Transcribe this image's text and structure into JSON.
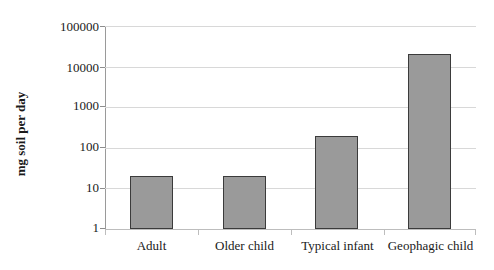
{
  "chart_data": {
    "type": "bar",
    "title": "",
    "subtitle": "",
    "xlabel": "",
    "ylabel": "mg soil per day",
    "categories": [
      "Adult",
      "Older child",
      "Typical infant",
      "Geophagic child"
    ],
    "values": [
      20,
      20,
      200,
      20000
    ],
    "series": [
      {
        "name": "mg soil per day",
        "values": [
          20,
          20,
          200,
          20000
        ]
      }
    ],
    "yscale": "log",
    "ylim": [
      1,
      100000
    ],
    "ytick_labels": [
      "1",
      "10",
      "100",
      "1000",
      "10000",
      "100000"
    ],
    "ytick_values": [
      1,
      10,
      100,
      1000,
      10000,
      100000
    ],
    "grid": "horizontal",
    "legend": "none",
    "bar_fill_color": "#9a9a9a",
    "bar_border_color": "#3b3b3b",
    "gridline_color": "#d8d8d8",
    "axis_color": "#9a9a9a",
    "background_color": "#ffffff"
  }
}
